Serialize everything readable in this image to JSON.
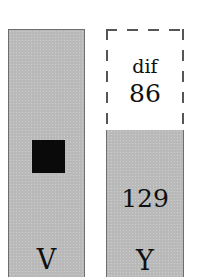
{
  "figure": {
    "type": "bar-comparison-diagram",
    "background_color": "#ffffff",
    "bar_fill_color": "#b9b9b9",
    "bar_border_color": "#6e6e6e",
    "marker_color": "#0a0a0a",
    "dashed_border_color": "#555555",
    "text_color": "#101010"
  },
  "left_bar": {
    "label": "V",
    "marker": {
      "shape": "filled-square",
      "name": "black-square-marker"
    }
  },
  "right_bar": {
    "label": "Y",
    "value": "129"
  },
  "difference_box": {
    "label": "dif",
    "value": "86",
    "style": "dashed-outline"
  },
  "chart_data": {
    "type": "bar",
    "title": "",
    "xlabel": "",
    "ylabel": "",
    "categories": [
      "V",
      "Y"
    ],
    "values": [
      215,
      129
    ],
    "value_labels": [
      "",
      "129"
    ],
    "annotations": [
      {
        "name": "dif",
        "label": "dif",
        "value": 86,
        "value_text": "86",
        "attached_to": "Y",
        "style": "dashed-outline",
        "description": "dashed box above the Y bar showing the difference 86 between V and Y"
      },
      {
        "name": "marker",
        "label": "",
        "attached_to": "V",
        "style": "filled-black-square"
      }
    ],
    "grid": false,
    "legend": false
  }
}
